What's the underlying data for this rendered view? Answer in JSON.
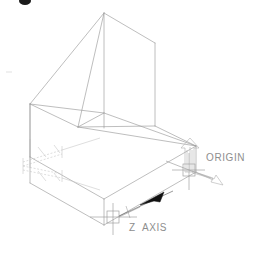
{
  "drawing": {
    "title": "Isometric block with angled top - origin and Z axis annotation",
    "background_color": "#ffffff",
    "line_color": "#9a9a9a",
    "line_color_faint": "#c0c0c0",
    "text_color": "#8e8e8e",
    "arrow_fill": "#000000",
    "stroke_width": 0.6
  },
  "labels": {
    "origin": "ORIGIN",
    "z_axis": "Z  AXIS"
  },
  "markers": {
    "origin_marker": "crosshair-square-marker",
    "zaxis_marker": "crosshair-square-marker",
    "origin_up_arrow": "up-arrow-outline",
    "origin_down_right_arrow": "down-right-arrow-outline",
    "zaxis_leader_arrow": "solid-arrowhead",
    "cursor_blob": "cursor-arrow"
  },
  "geometry": {
    "view": "isometric",
    "solid": {
      "name": "block-with-angled-top",
      "base_box": {
        "front_left": [
          30,
          157
        ],
        "front_center": [
          104,
          199
        ],
        "front_right": [
          196,
          146
        ],
        "back_center": [
          104,
          113
        ],
        "bottom_left": [
          30,
          183
        ],
        "bottom_center": [
          104,
          225
        ],
        "bottom_right": [
          196,
          172
        ]
      },
      "wedge_top": {
        "apex": [
          104,
          13
        ],
        "right_top": [
          155,
          43
        ],
        "left_ridge": [
          30,
          104
        ],
        "slope_foot": [
          78,
          127
        ],
        "right_foot": [
          155,
          126
        ]
      }
    },
    "dimension_block": {
      "position": [
        18,
        146
      ],
      "size": [
        46,
        40
      ],
      "style": "dashed-isometric-dimension-lines"
    }
  },
  "annotations": [
    {
      "name": "origin",
      "text": "ORIGIN",
      "anchor": [
        196,
        172
      ],
      "label_pos": [
        206,
        152
      ]
    },
    {
      "name": "z-axis",
      "text": "Z  AXIS",
      "anchor": [
        119,
        217
      ],
      "label_pos": [
        129,
        222
      ]
    }
  ]
}
